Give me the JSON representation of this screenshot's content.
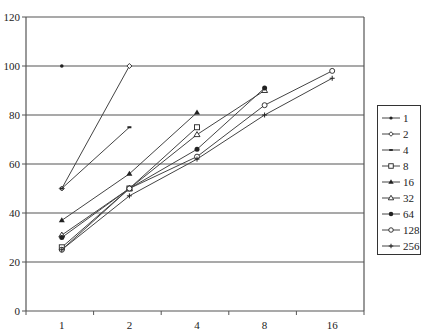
{
  "chart_data": {
    "type": "line",
    "title": "",
    "xlabel": "",
    "ylabel": "",
    "categories": [
      "1",
      "2",
      "4",
      "8",
      "16"
    ],
    "ylim": [
      0,
      120
    ],
    "yticks": [
      0,
      20,
      40,
      60,
      80,
      100,
      120
    ],
    "grid": "horizontal",
    "legend_position": "right",
    "series": [
      {
        "name": "1",
        "marker": "small-filled-dot",
        "values": [
          100,
          null,
          null,
          null,
          null
        ]
      },
      {
        "name": "2",
        "marker": "open-diamond",
        "values": [
          50,
          100,
          null,
          null,
          null
        ]
      },
      {
        "name": "4",
        "marker": "dash",
        "values": [
          50,
          75,
          null,
          null,
          null
        ]
      },
      {
        "name": "8",
        "marker": "open-square",
        "values": [
          26,
          50,
          75,
          null,
          null
        ]
      },
      {
        "name": "16",
        "marker": "filled-triangle",
        "values": [
          37,
          56,
          81,
          null,
          null
        ]
      },
      {
        "name": "32",
        "marker": "open-triangle",
        "values": [
          31,
          50,
          72,
          90,
          null
        ]
      },
      {
        "name": "64",
        "marker": "filled-circle",
        "values": [
          30,
          50,
          66,
          91,
          null
        ]
      },
      {
        "name": "128",
        "marker": "open-circle",
        "values": [
          25,
          50,
          63,
          84,
          98
        ]
      },
      {
        "name": "256",
        "marker": "plus",
        "values": [
          25,
          47,
          62,
          80,
          95
        ]
      }
    ]
  }
}
